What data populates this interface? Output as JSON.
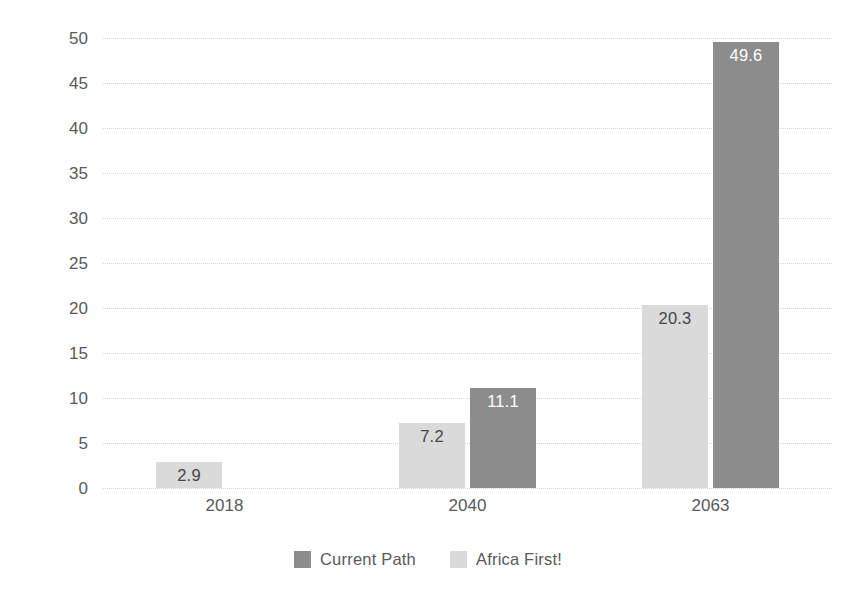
{
  "chart_data": {
    "type": "bar",
    "title": "",
    "subtitle": "",
    "xlabel": "",
    "ylabel": "Trillion 2017 US$",
    "categories": [
      "2018",
      "2040",
      "2063"
    ],
    "series": [
      {
        "name": "Current Path",
        "color": "#8c8c8c",
        "values": [
          null,
          11.1,
          49.6
        ],
        "labels": [
          "",
          "11.1",
          "49.6"
        ]
      },
      {
        "name": "Africa First!",
        "color": "#d9dad9",
        "values": [
          2.9,
          7.2,
          20.3
        ],
        "labels": [
          "2.9",
          "7.2",
          "20.3"
        ]
      }
    ],
    "ylim": [
      0,
      50
    ],
    "yticks": [
      0,
      5,
      10,
      15,
      20,
      25,
      30,
      35,
      40,
      45,
      50
    ],
    "ytick_labels": [
      "0",
      "5",
      "10",
      "15",
      "20",
      "25",
      "30",
      "35",
      "40",
      "45",
      "50"
    ],
    "grid": true,
    "grid_axis": "y",
    "grid_style": "dotted",
    "grid_color": "#d6d7d8",
    "legend_position": "bottom-center",
    "bar_group_order": [
      "Africa First!",
      "Current Path"
    ],
    "background_color": "#ffffff",
    "text_color": "#58595b"
  },
  "legend": {
    "items": [
      {
        "label": "Current Path",
        "color": "#8c8c8c"
      },
      {
        "label": "Africa First!",
        "color": "#d9dad9"
      }
    ]
  }
}
